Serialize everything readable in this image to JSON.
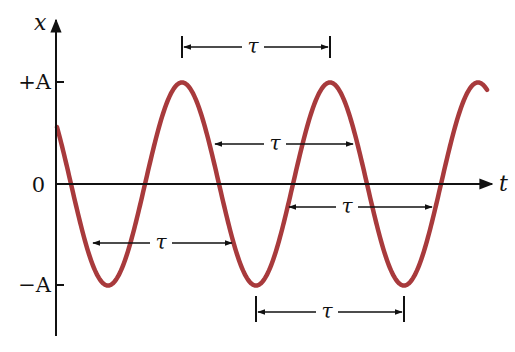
{
  "diagram": {
    "axes": {
      "y_label": "x",
      "x_label": "t",
      "ticks": [
        {
          "label": "+A",
          "value": "A"
        },
        {
          "label": "0",
          "value": "0"
        },
        {
          "label": "−A",
          "value": "-A"
        }
      ]
    },
    "period_symbol": "τ",
    "period_annotations": [
      {
        "from": "peak 1",
        "to": "peak 2",
        "label": "τ",
        "position": "above peaks"
      },
      {
        "from": "descending slope",
        "to": "next descending slope",
        "label": "τ",
        "position": "upper half"
      },
      {
        "from": "ascending zero crossing",
        "to": "next ascending zero crossing",
        "label": "τ",
        "position": "below axis"
      },
      {
        "from": "descending slope",
        "to": "next descending slope",
        "label": "τ",
        "position": "lower half"
      },
      {
        "from": "trough 2",
        "to": "trough 3",
        "label": "τ",
        "position": "below troughs"
      }
    ],
    "colors": {
      "curve": "#a83a3c",
      "axes": "#111111",
      "background": "#ffffff"
    }
  }
}
